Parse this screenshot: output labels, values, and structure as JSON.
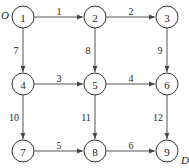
{
  "diagram": {
    "type": "directed-grid-network",
    "origin_label": "O",
    "destination_label": "D",
    "nodes": [
      {
        "id": "1",
        "label": "1",
        "x": 23,
        "y": 17
      },
      {
        "id": "2",
        "label": "2",
        "x": 95,
        "y": 17
      },
      {
        "id": "3",
        "label": "3",
        "x": 167,
        "y": 17
      },
      {
        "id": "4",
        "label": "4",
        "x": 23,
        "y": 84
      },
      {
        "id": "5",
        "label": "5",
        "x": 95,
        "y": 84
      },
      {
        "id": "6",
        "label": "6",
        "x": 167,
        "y": 84
      },
      {
        "id": "7",
        "label": "7",
        "x": 23,
        "y": 151
      },
      {
        "id": "8",
        "label": "8",
        "x": 95,
        "y": 151
      },
      {
        "id": "9",
        "label": "9",
        "x": 167,
        "y": 151
      }
    ],
    "edges": [
      {
        "from": "1",
        "to": "2",
        "label": "1"
      },
      {
        "from": "2",
        "to": "3",
        "label": "2"
      },
      {
        "from": "4",
        "to": "5",
        "label": "3"
      },
      {
        "from": "5",
        "to": "6",
        "label": "4"
      },
      {
        "from": "7",
        "to": "8",
        "label": "5"
      },
      {
        "from": "8",
        "to": "9",
        "label": "6"
      },
      {
        "from": "1",
        "to": "4",
        "label": "7"
      },
      {
        "from": "2",
        "to": "5",
        "label": "8"
      },
      {
        "from": "3",
        "to": "6",
        "label": "9"
      },
      {
        "from": "4",
        "to": "7",
        "label": "10"
      },
      {
        "from": "5",
        "to": "8",
        "label": "11"
      },
      {
        "from": "6",
        "to": "9",
        "label": "12"
      }
    ]
  }
}
